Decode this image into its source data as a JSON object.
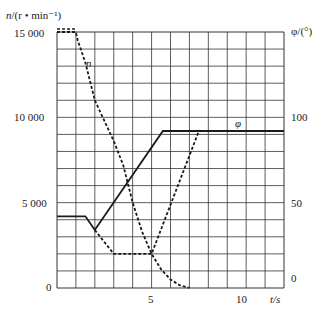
{
  "chart_data": {
    "type": "line",
    "title": "",
    "xlabel": "t/s",
    "ylabel_left": "n/(r • min⁻¹)",
    "ylabel_right": "φ/(°)",
    "xlim": [
      0,
      12
    ],
    "ylim_left": [
      0,
      15000
    ],
    "ylim_right": [
      0,
      150
    ],
    "x_ticks": [
      0,
      5,
      10
    ],
    "y_ticks_left": [
      "0",
      "5 000",
      "10 000",
      "15 000"
    ],
    "y_ticks_right": [
      "0",
      "50",
      "100"
    ],
    "grid": true,
    "series": [
      {
        "name": "n",
        "style": "dashed",
        "axis": "left",
        "points": [
          [
            0,
            15000
          ],
          [
            1,
            15000
          ],
          [
            1.1,
            14500
          ],
          [
            1.5,
            13200
          ],
          [
            2,
            11000
          ],
          [
            2.5,
            9800
          ],
          [
            3,
            8600
          ],
          [
            3.5,
            7200
          ],
          [
            4,
            5000
          ],
          [
            4.5,
            3300
          ],
          [
            5,
            2000
          ],
          [
            5.5,
            1100
          ],
          [
            6,
            500
          ],
          [
            6.5,
            150
          ],
          [
            7,
            0
          ]
        ]
      },
      {
        "name": "n (secondary branch)",
        "style": "dashed",
        "axis": "left",
        "points": [
          [
            2,
            3400
          ],
          [
            3,
            2000
          ],
          [
            5,
            2000
          ],
          [
            7.5,
            9200
          ]
        ]
      },
      {
        "name": "φ",
        "style": "solid",
        "axis": "right",
        "points": [
          [
            0,
            42
          ],
          [
            1.5,
            42
          ],
          [
            2,
            34
          ],
          [
            5.6,
            92
          ],
          [
            12,
            92
          ]
        ]
      }
    ],
    "annotations": [
      {
        "text": "n",
        "x": 1.6,
        "y": 13200
      },
      {
        "text": "φ",
        "x": 9.5,
        "y": 9500
      }
    ]
  },
  "labels": {
    "ylabel_left": "n/(r • min⁻¹)",
    "ylabel_right": "φ/(°)",
    "xlabel": "t/s",
    "left_ticks": [
      "15 000",
      "10 000",
      "5 000",
      "0"
    ],
    "right_ticks": [
      "100",
      "50",
      "0"
    ],
    "x_ticks": [
      "5",
      "10"
    ],
    "series_n": "n",
    "series_phi": "φ"
  }
}
